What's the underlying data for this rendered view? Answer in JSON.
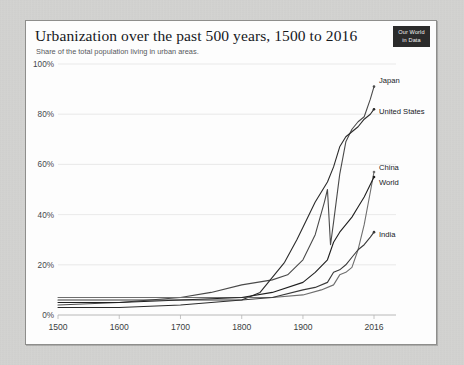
{
  "header": {
    "title": "Urbanization over the past 500 years, 1500 to 2016",
    "subtitle": "Share of the total population living in urban areas.",
    "logo_line1": "Our World",
    "logo_line2": "in Data"
  },
  "chart_data": {
    "type": "line",
    "title": "Urbanization over the past 500 years, 1500 to 2016",
    "subtitle": "Share of the total population living in urban areas.",
    "xlabel": "",
    "ylabel": "",
    "xlim": [
      1500,
      2016
    ],
    "ylim": [
      0,
      100
    ],
    "grid": true,
    "legend": "right-inline-labels",
    "ytick_labels": [
      "0%",
      "20%",
      "40%",
      "60%",
      "80%",
      "100%"
    ],
    "ytick_values": [
      0,
      20,
      40,
      60,
      80,
      100
    ],
    "xtick_labels": [
      "1500",
      "1600",
      "1700",
      "1800",
      "1900",
      "2016"
    ],
    "xtick_values": [
      1500,
      1600,
      1700,
      1800,
      1900,
      2016
    ],
    "series": [
      {
        "name": "Japan",
        "color": "#4a4a4a",
        "x": [
          1500,
          1600,
          1700,
          1750,
          1800,
          1850,
          1875,
          1900,
          1920,
          1935,
          1940,
          1945,
          1950,
          1960,
          1970,
          1980,
          1990,
          2000,
          2010,
          2016
        ],
        "values": [
          4,
          5,
          7,
          9,
          12,
          14,
          16,
          22,
          32,
          45,
          50,
          28,
          37,
          56,
          69,
          74,
          77,
          79,
          86,
          91
        ]
      },
      {
        "name": "United States",
        "color": "#2b2b2b",
        "x": [
          1500,
          1600,
          1700,
          1750,
          1800,
          1830,
          1850,
          1870,
          1890,
          1900,
          1920,
          1940,
          1950,
          1960,
          1970,
          1980,
          1990,
          2000,
          2010,
          2016
        ],
        "values": [
          3,
          3,
          4,
          5,
          6,
          9,
          15,
          21,
          30,
          35,
          45,
          53,
          59,
          67,
          71,
          73,
          75,
          78,
          80,
          82
        ]
      },
      {
        "name": "China",
        "color": "#6e6e6e",
        "x": [
          1500,
          1600,
          1700,
          1800,
          1850,
          1900,
          1930,
          1950,
          1960,
          1970,
          1980,
          1990,
          2000,
          2010,
          2016
        ],
        "values": [
          7,
          7,
          7,
          7,
          7,
          8,
          10,
          12,
          16,
          17,
          19,
          26,
          36,
          49,
          57
        ]
      },
      {
        "name": "World",
        "color": "#1f1f1f",
        "x": [
          1500,
          1600,
          1700,
          1800,
          1850,
          1900,
          1920,
          1940,
          1950,
          1960,
          1970,
          1980,
          1990,
          2000,
          2010,
          2016
        ],
        "values": [
          5,
          5,
          6,
          7,
          9,
          13,
          17,
          22,
          29,
          33,
          36,
          39,
          43,
          47,
          52,
          55
        ]
      },
      {
        "name": "India",
        "color": "#3a3a3a",
        "x": [
          1500,
          1600,
          1700,
          1800,
          1850,
          1900,
          1920,
          1940,
          1950,
          1960,
          1970,
          1980,
          1990,
          2000,
          2010,
          2016
        ],
        "values": [
          6,
          6,
          6,
          6,
          7,
          10,
          11,
          13,
          17,
          18,
          20,
          23,
          26,
          28,
          31,
          33
        ]
      }
    ],
    "annotations": [
      {
        "label": "Japan",
        "value": 91
      },
      {
        "label": "United States",
        "value": 82
      },
      {
        "label": "China",
        "value": 57
      },
      {
        "label": "World",
        "value": 55
      },
      {
        "label": "India",
        "value": 33
      }
    ]
  }
}
